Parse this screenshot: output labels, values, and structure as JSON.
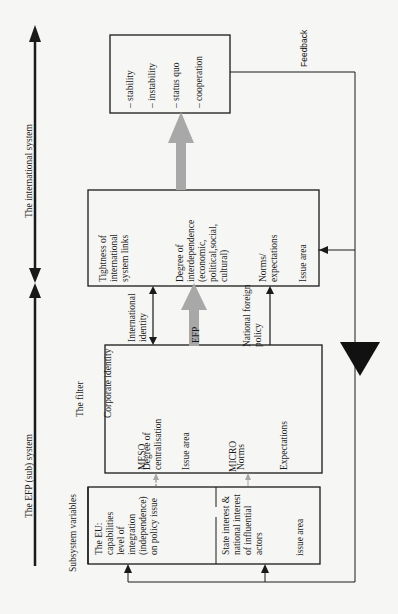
{
  "axis": {
    "international_label": "The international system",
    "efp_label": "The EFP (sub) system"
  },
  "labels": {
    "subsystem_variables": "Subsystem variables",
    "the_filter": "The filter",
    "corporate_identity": "Corporate identity",
    "meso": "MESO",
    "micro": "MICRO",
    "international_identity": "International\nidentity",
    "efp": "EFP",
    "national_foreign_policy": "National foreign\npolicy",
    "feedback": "Feedback"
  },
  "boxes": {
    "eu": "The EU:\ncapabilities\nlevel of\nintegration\n(independence)\non policy issue",
    "state": "State interest &\nnational interest\nof influential\nactors",
    "state_issue": "issue area",
    "filter_centralisation": "Degree of\ncentralisation",
    "filter_issue": "Issue area",
    "filter_norms": "Norms",
    "filter_expectations": "Expectations",
    "intl_tightness": "Tightness of\ninternational\nsystem links",
    "intl_interdependence": "Degree of\ninterdependence\n(economic,\npolitical,social,\ncultural)",
    "intl_norms": "Norms/\nexpectations",
    "intl_issue": "Issue area",
    "outcomes": [
      "– stability",
      "– instability",
      "– status quo",
      "– cooperation"
    ]
  },
  "colors": {
    "line": "#1a1a1a",
    "gray_arrow": "#a8a8a8",
    "background": "#f6f6f4"
  }
}
